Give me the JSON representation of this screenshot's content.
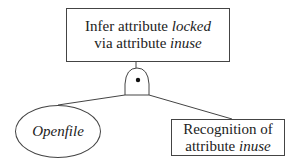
{
  "diagram": {
    "type": "attack-tree",
    "root": {
      "line1_prefix": "Infer attribute ",
      "line1_italic": "locked",
      "line2_prefix": "via attribute ",
      "line2_italic": "inuse"
    },
    "gate": {
      "type": "AND",
      "symbol": "and-gate-with-dot"
    },
    "children": [
      {
        "shape": "ellipse",
        "label": "Openfile"
      },
      {
        "shape": "box",
        "line1": "Recognition of",
        "line2_prefix": "attribute ",
        "line2_italic": "inuse"
      }
    ]
  }
}
